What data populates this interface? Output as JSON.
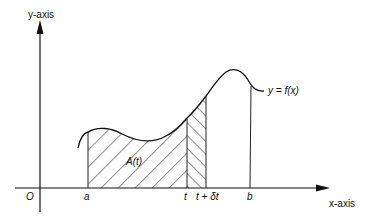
{
  "diagram": {
    "type": "area-under-curve",
    "y_axis_label": "y-axis",
    "x_axis_label": "x-axis",
    "origin_label": "O",
    "curve_label": "y = f(x)",
    "area_label": "A(t)",
    "x_ticks": [
      {
        "label": "a"
      },
      {
        "label": "t"
      },
      {
        "label": "t + δt"
      },
      {
        "label": "b"
      }
    ],
    "colors": {
      "line": "#111111",
      "background": "#ffffff"
    }
  }
}
